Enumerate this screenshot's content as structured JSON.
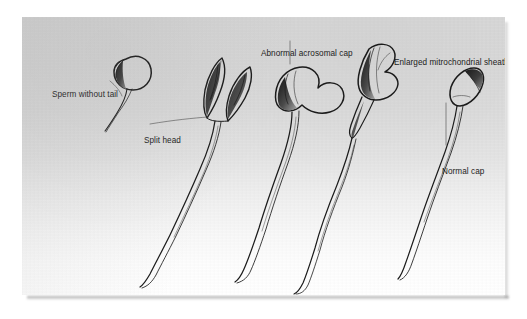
{
  "figure": {
    "kind": "scanned-illustration",
    "background_top_color": "#d8d8d8",
    "background_bottom_color": "#ffffff",
    "ink_color": "#1b1b1b",
    "label_color": "#1c1c1c"
  },
  "labels": [
    {
      "id": "sperm-without-tail",
      "text": "Sperm without tail"
    },
    {
      "id": "split-head",
      "text": "Split head"
    },
    {
      "id": "abnormal-cap",
      "text": "Abnormal acrosomal cap"
    },
    {
      "id": "enlarged-sheath",
      "text": "Enlarged mitrochondrial sheath"
    },
    {
      "id": "normal-cap",
      "text": "Normal cap"
    }
  ],
  "specimens": [
    {
      "id": "specimen-1",
      "label_ref": "sperm-without-tail",
      "head_shape": "round",
      "tail": "stub"
    },
    {
      "id": "specimen-2",
      "label_ref": "split-head",
      "head_shape": "two elongated lobes",
      "tail": "long wavy"
    },
    {
      "id": "specimen-3",
      "label_ref": "abnormal-cap",
      "head_shape": "heart / kidney",
      "tail": "long wavy"
    },
    {
      "id": "specimen-4",
      "label_ref": "enlarged-sheath",
      "head_shape": "elongated with thick midpiece",
      "tail": "long wavy"
    },
    {
      "id": "specimen-5",
      "label_ref": "normal-cap",
      "head_shape": "oval",
      "tail": "long wavy"
    }
  ]
}
